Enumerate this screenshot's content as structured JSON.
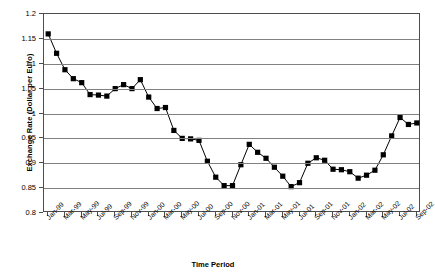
{
  "chart_data": {
    "type": "line",
    "title": "",
    "xlabel": "Time Period",
    "ylabel": "Exchange Rate (Dollar per Euro)",
    "ylim": [
      0.8,
      1.2
    ],
    "ytick_labels": [
      "1.2",
      "1.15",
      "1.1",
      "1.05",
      "1",
      "0.95",
      "0.9",
      "0.85",
      "0.8"
    ],
    "ytick_values": [
      1.2,
      1.15,
      1.1,
      1.05,
      1.0,
      0.95,
      0.9,
      0.85,
      0.8
    ],
    "grid": true,
    "legend": "none",
    "marker": "square",
    "marker_color": "#000000",
    "line_color": "#000000",
    "x_tick_labels": [
      "Jan-99",
      "Mar-99",
      "May-99",
      "Jul-99",
      "Sep-99",
      "Nov-99",
      "Jan-00",
      "Mar-00",
      "May-00",
      "Jul-00",
      "Sep-00",
      "Nov-00",
      "Jan-01",
      "Mar-01",
      "May-01",
      "Jul-01",
      "Sep-01",
      "Nov-01",
      "Jan-02",
      "Mar-02",
      "May-02",
      "Jul-02",
      "Sep-02"
    ],
    "x": [
      "Jan-99",
      "Feb-99",
      "Mar-99",
      "Apr-99",
      "May-99",
      "Jun-99",
      "Jul-99",
      "Aug-99",
      "Sep-99",
      "Oct-99",
      "Nov-99",
      "Dec-99",
      "Jan-00",
      "Feb-00",
      "Mar-00",
      "Apr-00",
      "May-00",
      "Jun-00",
      "Jul-00",
      "Aug-00",
      "Sep-00",
      "Oct-00",
      "Nov-00",
      "Dec-00",
      "Jan-01",
      "Feb-01",
      "Mar-01",
      "Apr-01",
      "May-01",
      "Jun-01",
      "Jul-01",
      "Aug-01",
      "Sep-01",
      "Oct-01",
      "Nov-01",
      "Dec-01",
      "Jan-02",
      "Feb-02",
      "Mar-02",
      "Apr-02",
      "May-02",
      "Jun-02",
      "Jul-02",
      "Aug-02",
      "Sep-02"
    ],
    "values": [
      1.16,
      1.121,
      1.088,
      1.07,
      1.062,
      1.038,
      1.037,
      1.035,
      1.05,
      1.058,
      1.05,
      1.068,
      1.033,
      1.01,
      1.012,
      0.966,
      0.95,
      0.949,
      0.946,
      0.904,
      0.872,
      0.855,
      0.855,
      0.897,
      0.938,
      0.922,
      0.91,
      0.892,
      0.874,
      0.853,
      0.861,
      0.9,
      0.911,
      0.906,
      0.888,
      0.887,
      0.883,
      0.87,
      0.876,
      0.886,
      0.917,
      0.955,
      0.992,
      0.978,
      0.981
    ],
    "series_name": "Dollar per Euro"
  }
}
